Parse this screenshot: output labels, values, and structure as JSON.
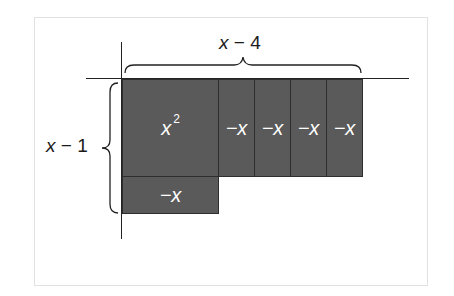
{
  "diagram": {
    "type": "algebra-tile-model",
    "colors": {
      "tile_fill": "#5a5a5a",
      "tile_border": "#2e2e2e",
      "tile_text": "#ffffff",
      "axis": "#222222",
      "frame": "#e2e2e2"
    },
    "top_dimension": {
      "variable": "x",
      "operator": "−",
      "constant": "4"
    },
    "left_dimension": {
      "variable": "x",
      "operator": "−",
      "constant": "1"
    },
    "tiles": [
      {
        "id": "x-squared",
        "label": "x",
        "exponent": "2"
      },
      {
        "id": "neg-x-1",
        "label": "−x"
      },
      {
        "id": "neg-x-2",
        "label": "−x"
      },
      {
        "id": "neg-x-3",
        "label": "−x"
      },
      {
        "id": "neg-x-4",
        "label": "−x"
      },
      {
        "id": "neg-x-bottom",
        "label": "−x"
      }
    ]
  }
}
